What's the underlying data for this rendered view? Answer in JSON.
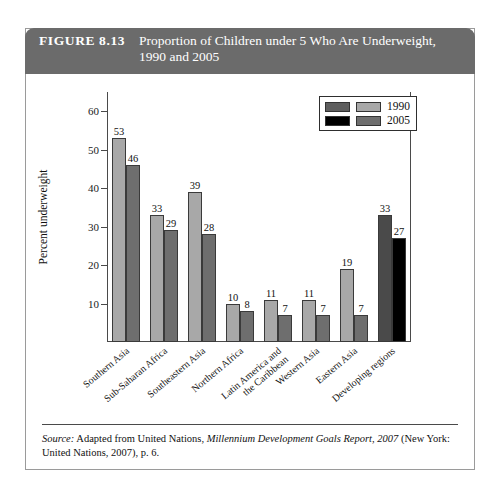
{
  "figure": {
    "number": "FIGURE 8.13",
    "title": "Proportion of Children under 5 Who Are Underweight, 1990 and 2005",
    "header_bg": "#6b6b6b"
  },
  "source": {
    "label": "Source:",
    "text_before": " Adapted from United Nations, ",
    "italic_title": "Millennium Development Goals Report, 2007",
    "text_after": " (New York: United Nations, 2007), p. 6."
  },
  "legend": {
    "entries": [
      {
        "label": "1990",
        "swatch_a": "#5e5e5e",
        "swatch_b": "#a8a8a8"
      },
      {
        "label": "2005",
        "swatch_a": "#000000",
        "swatch_b": "#6e6e6e"
      }
    ]
  },
  "chart_data": {
    "type": "bar",
    "title": "Proportion of Children under 5 Who Are Underweight, 1990 and 2005",
    "xlabel": "",
    "ylabel": "Percent underweight",
    "ylim": [
      0,
      65
    ],
    "yticks": [
      10,
      20,
      30,
      40,
      50,
      60
    ],
    "grid": false,
    "legend_position": "top-right",
    "categories": [
      "Southern Asia",
      "Sub-Saharan Africa",
      "Southeastern Asia",
      "Northern Africa",
      "Latin America and the Caribbean",
      "Western Asia",
      "Eastern Asia",
      "Developing regions"
    ],
    "series": [
      {
        "name": "1990",
        "values": [
          53,
          33,
          39,
          10,
          11,
          11,
          19,
          33
        ],
        "color": "#a8a8a8",
        "highlight_color": "#4a4a4a"
      },
      {
        "name": "2005",
        "values": [
          46,
          29,
          28,
          8,
          7,
          7,
          7,
          27
        ],
        "color": "#6e6e6e",
        "highlight_color": "#000000"
      }
    ],
    "highlight_category": "Developing regions"
  }
}
